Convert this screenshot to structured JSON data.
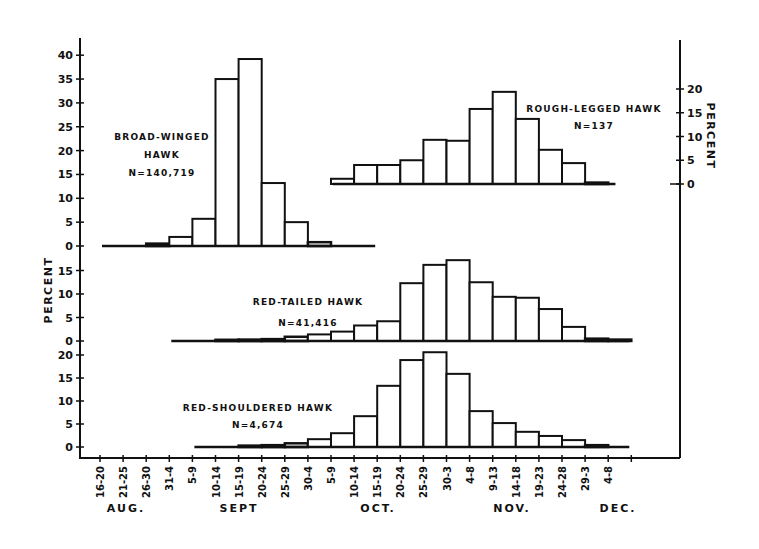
{
  "chart_data": {
    "type": "bar",
    "title": "",
    "xlabel": "",
    "ylabel": "PERCENT",
    "grid": false,
    "x": [
      "16-20",
      "21-25",
      "26-30",
      "31-4",
      "5-9",
      "10-14",
      "15-19",
      "20-24",
      "25-29",
      "30-4",
      "5-9",
      "10-14",
      "15-19",
      "20-24",
      "25-29",
      "30-3",
      "4-8",
      "9-13",
      "14-18",
      "19-23",
      "24-28",
      "29-3",
      "4-8"
    ],
    "month_labels": [
      {
        "label": "AUG.",
        "after_index": 1
      },
      {
        "label": "SEPT",
        "after_index": 5
      },
      {
        "label": "OCT.",
        "after_index": 11
      },
      {
        "label": "NOV.",
        "after_index": 18
      },
      {
        "label": "DEC.",
        "after_index": 22
      }
    ],
    "panels": [
      {
        "name": "BROAD-WINGED HAWK",
        "label_lines": [
          "BROAD-WINGED",
          "HAWK",
          "N=140,719"
        ],
        "n": "N=140,719",
        "axis": "left",
        "yticks": [
          0,
          5,
          10,
          15,
          20,
          25,
          30,
          35,
          40
        ],
        "ylim": [
          0,
          40
        ],
        "baseline_range": [
          0,
          12
        ],
        "bars": [
          {
            "start": 2,
            "value": 0.5
          },
          {
            "start": 3,
            "value": 1.9
          },
          {
            "start": 4,
            "value": 5.7
          },
          {
            "start": 5,
            "value": 35.0
          },
          {
            "start": 6,
            "value": 39.2
          },
          {
            "start": 7,
            "value": 13.2
          },
          {
            "start": 8,
            "value": 5.0
          },
          {
            "start": 9,
            "value": 0.8
          }
        ]
      },
      {
        "name": "ROUGH-LEGGED HAWK",
        "label_lines": [
          "ROUGH-LEGGED HAWK",
          "N=137"
        ],
        "n": "N=137",
        "axis": "right",
        "yticks": [
          0,
          5,
          10,
          15,
          20
        ],
        "ylim": [
          0,
          20
        ],
        "baseline_range": [
          10,
          22.4
        ],
        "bars": [
          {
            "start": 10,
            "value": 1.1
          },
          {
            "start": 11,
            "value": 4.0
          },
          {
            "start": 12,
            "value": 4.0
          },
          {
            "start": 13,
            "value": 5.0
          },
          {
            "start": 14,
            "value": 9.3
          },
          {
            "start": 15,
            "value": 9.1
          },
          {
            "start": 16,
            "value": 15.8
          },
          {
            "start": 17,
            "value": 19.4
          },
          {
            "start": 18,
            "value": 13.7
          },
          {
            "start": 19,
            "value": 7.2
          },
          {
            "start": 20,
            "value": 4.4
          },
          {
            "start": 21,
            "value": 0.3
          }
        ]
      },
      {
        "name": "RED-TAILED HAWK",
        "label_lines": [
          "RED-TAILED HAWK",
          "N=41,416"
        ],
        "n": "N=41,416",
        "axis": "left",
        "yticks": [
          0,
          5,
          10,
          15
        ],
        "ylim": [
          0,
          15
        ],
        "baseline_range": [
          3,
          23
        ],
        "bars": [
          {
            "start": 5,
            "value": 0.2
          },
          {
            "start": 6,
            "value": 0.3
          },
          {
            "start": 7,
            "value": 0.4
          },
          {
            "start": 8,
            "value": 0.9
          },
          {
            "start": 9,
            "value": 1.4
          },
          {
            "start": 10,
            "value": 2.0
          },
          {
            "start": 11,
            "value": 3.3
          },
          {
            "start": 12,
            "value": 4.2
          },
          {
            "start": 13,
            "value": 12.3
          },
          {
            "start": 14,
            "value": 16.2
          },
          {
            "start": 15,
            "value": 17.2
          },
          {
            "start": 16,
            "value": 12.5
          },
          {
            "start": 17,
            "value": 9.4
          },
          {
            "start": 18,
            "value": 9.2
          },
          {
            "start": 19,
            "value": 6.8
          },
          {
            "start": 20,
            "value": 3.0
          },
          {
            "start": 21,
            "value": 0.5
          },
          {
            "start": 22,
            "value": 0.3
          }
        ]
      },
      {
        "name": "RED-SHOULDERED HAWK",
        "label_lines": [
          "RED-SHOULDERED HAWK",
          "N=4,674"
        ],
        "n": "N=4,674",
        "axis": "left",
        "yticks": [
          0,
          5,
          10,
          15,
          20
        ],
        "ylim": [
          0,
          20
        ],
        "baseline_range": [
          4,
          23
        ],
        "bars": [
          {
            "start": 6,
            "value": 0.3
          },
          {
            "start": 7,
            "value": 0.4
          },
          {
            "start": 8,
            "value": 0.8
          },
          {
            "start": 9,
            "value": 1.7
          },
          {
            "start": 10,
            "value": 3.0
          },
          {
            "start": 11,
            "value": 6.7
          },
          {
            "start": 12,
            "value": 13.3
          },
          {
            "start": 13,
            "value": 18.9
          },
          {
            "start": 14,
            "value": 20.6
          },
          {
            "start": 15,
            "value": 15.9
          },
          {
            "start": 16,
            "value": 7.8
          },
          {
            "start": 17,
            "value": 5.2
          },
          {
            "start": 18,
            "value": 3.3
          },
          {
            "start": 19,
            "value": 2.4
          },
          {
            "start": 20,
            "value": 1.5
          },
          {
            "start": 21,
            "value": 0.4
          }
        ]
      }
    ]
  },
  "axes": {
    "left_label": "PERCENT",
    "right_label": "PERCENT"
  },
  "colors": {
    "ink": "#111111",
    "background": "#ffffff",
    "bar_fill": "#ffffff"
  }
}
